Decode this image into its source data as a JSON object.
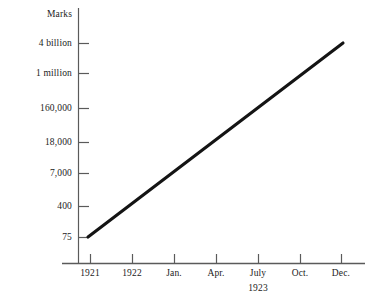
{
  "chart_data": {
    "type": "line",
    "title": "",
    "ylabel": "Marks",
    "xlabel": "",
    "y_scale": "log",
    "grid": false,
    "legend": false,
    "y_tick_labels": [
      "4 billion",
      "1 million",
      "160,000",
      "18,000",
      "7,000",
      "400",
      "75"
    ],
    "y_tick_values": [
      4000000000,
      1000000,
      160000,
      18000,
      7000,
      400,
      75
    ],
    "x_tick_labels": [
      "1921",
      "1922",
      "Jan.",
      "Apr.",
      "July",
      "Oct.",
      "Dec."
    ],
    "x_sublabel": "1923",
    "x_sublabel_under": "July",
    "categories": [
      "1921",
      "1922",
      "Jan.",
      "Apr.",
      "July",
      "Oct.",
      "Dec."
    ],
    "series": [
      {
        "name": "Marks per dollar",
        "values": [
          75,
          400,
          7000,
          18000,
          160000,
          1000000,
          4000000000
        ]
      }
    ],
    "line_color": "#141414",
    "axis_color": "#5a5a5a",
    "annotations": []
  },
  "axes": {
    "y_axis_title": "Marks",
    "y_ticks": [
      {
        "label": "4 billion",
        "y": 43
      },
      {
        "label": "1 million",
        "y": 73
      },
      {
        "label": "160,000",
        "y": 108
      },
      {
        "label": "18,000",
        "y": 142
      },
      {
        "label": "7,000",
        "y": 173
      },
      {
        "label": "400",
        "y": 206
      },
      {
        "label": "75",
        "y": 237
      }
    ],
    "x_ticks": [
      {
        "label": "1921",
        "x": 90
      },
      {
        "label": "1922",
        "x": 132
      },
      {
        "label": "Jan.",
        "x": 174
      },
      {
        "label": "Apr.",
        "x": 216
      },
      {
        "label": "July",
        "x": 258
      },
      {
        "label": "Oct.",
        "x": 300
      },
      {
        "label": "Dec.",
        "x": 341
      }
    ],
    "sub_label": "1923"
  },
  "colors": {
    "line": "#141414",
    "axis": "#5a5a5a",
    "text": "#1b1b1b",
    "background": "#ffffff"
  }
}
